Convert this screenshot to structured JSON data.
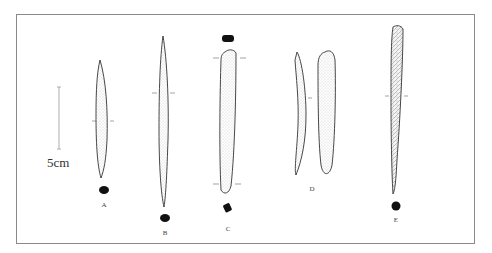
{
  "figure": {
    "scale_bar": {
      "label": "5cm"
    },
    "artifacts": [
      {
        "id": "A",
        "label": "A"
      },
      {
        "id": "B",
        "label": "B"
      },
      {
        "id": "C",
        "label": "C"
      },
      {
        "id": "D",
        "label": "D"
      },
      {
        "id": "E",
        "label": "E"
      }
    ],
    "colors": {
      "frame": "#8a8a8a",
      "outline": "#333333",
      "section": "#111111",
      "stipple": "#9a9a9a"
    }
  }
}
